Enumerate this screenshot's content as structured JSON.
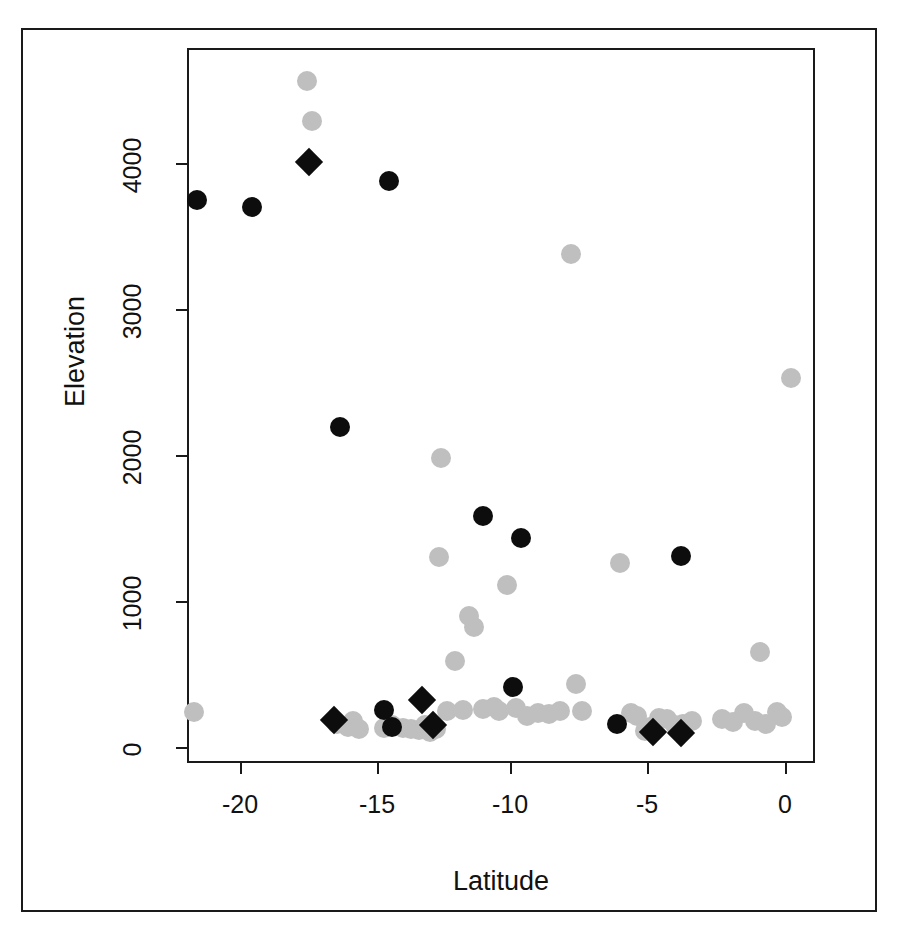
{
  "figure": {
    "background_color": "#ffffff",
    "frame_color": "#1a1a1a",
    "axis_label_x": "Latitude",
    "axis_label_y": "Elevation"
  },
  "axes": {
    "x_ticks": [
      "-20",
      "-15",
      "-10",
      "-5",
      "0"
    ],
    "y_ticks": [
      "0",
      "1000",
      "2000",
      "3000",
      "4000"
    ]
  },
  "chart_data": {
    "type": "scatter",
    "title": "",
    "xlabel": "Latitude",
    "ylabel": "Elevation",
    "xlim": [
      -22.2,
      1.2
    ],
    "ylim": [
      -230,
      4720
    ],
    "xticks": [
      -20,
      -15,
      -10,
      -5,
      0
    ],
    "yticks": [
      0,
      1000,
      2000,
      3000,
      4000
    ],
    "grid": false,
    "legend": "none",
    "colors": {
      "gray_marker": "#bfbfbf",
      "black_marker": "#0d0d0d"
    },
    "series": [
      {
        "name": "gray-circles",
        "marker": "circle",
        "color": "#bfbfbf",
        "points": [
          [
            -21.5,
            240
          ],
          [
            -17.4,
            4560
          ],
          [
            -17.2,
            4290
          ],
          [
            -16.3,
            160
          ],
          [
            -15.9,
            140
          ],
          [
            -15.7,
            175
          ],
          [
            -15.5,
            120
          ],
          [
            -14.6,
            130
          ],
          [
            -14.3,
            150
          ],
          [
            -13.9,
            130
          ],
          [
            -13.6,
            120
          ],
          [
            -13.3,
            115
          ],
          [
            -13.1,
            150
          ],
          [
            -12.9,
            105
          ],
          [
            -12.7,
            120
          ],
          [
            -12.5,
            1980
          ],
          [
            -12.6,
            1300
          ],
          [
            -12.3,
            250
          ],
          [
            -12.0,
            590
          ],
          [
            -11.7,
            255
          ],
          [
            -11.5,
            900
          ],
          [
            -11.3,
            820
          ],
          [
            -11.0,
            260
          ],
          [
            -10.6,
            275
          ],
          [
            -10.4,
            250
          ],
          [
            -10.1,
            1110
          ],
          [
            -9.8,
            270
          ],
          [
            -9.4,
            215
          ],
          [
            -9.0,
            230
          ],
          [
            -8.6,
            225
          ],
          [
            -8.2,
            250
          ],
          [
            -7.8,
            3380
          ],
          [
            -7.6,
            430
          ],
          [
            -7.4,
            245
          ],
          [
            -6.0,
            1260
          ],
          [
            -5.6,
            230
          ],
          [
            -5.4,
            215
          ],
          [
            -5.1,
            110
          ],
          [
            -4.9,
            135
          ],
          [
            -4.6,
            200
          ],
          [
            -4.3,
            195
          ],
          [
            -4.0,
            150
          ],
          [
            -3.7,
            160
          ],
          [
            -3.4,
            175
          ],
          [
            -2.3,
            190
          ],
          [
            -1.9,
            170
          ],
          [
            -1.5,
            230
          ],
          [
            -1.1,
            180
          ],
          [
            -0.9,
            650
          ],
          [
            -0.7,
            155
          ],
          [
            -0.3,
            240
          ],
          [
            -0.1,
            205
          ],
          [
            0.2,
            2530
          ]
        ]
      },
      {
        "name": "black-circles",
        "marker": "circle",
        "color": "#0d0d0d",
        "points": [
          [
            -21.4,
            3750
          ],
          [
            -19.4,
            3700
          ],
          [
            -14.4,
            3880
          ],
          [
            -16.2,
            2190
          ],
          [
            -11.0,
            1580
          ],
          [
            -9.6,
            1430
          ],
          [
            -3.8,
            1310
          ],
          [
            -14.6,
            255
          ],
          [
            -14.3,
            140
          ],
          [
            -9.9,
            410
          ],
          [
            -6.1,
            160
          ]
        ]
      },
      {
        "name": "black-diamonds",
        "marker": "diamond",
        "color": "#0d0d0d",
        "points": [
          [
            -17.3,
            4010
          ],
          [
            -16.4,
            185
          ],
          [
            -13.2,
            320
          ],
          [
            -12.8,
            150
          ],
          [
            -4.8,
            100
          ],
          [
            -3.8,
            95
          ]
        ]
      }
    ]
  }
}
